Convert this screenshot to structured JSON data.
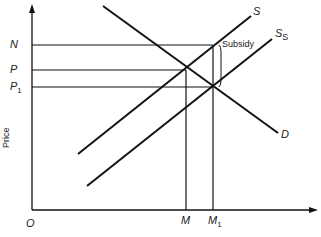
{
  "diagram": {
    "title": "",
    "y_axis_label": "Price",
    "origin_label": "O",
    "price_labels": [
      {
        "id": "N",
        "text": "N",
        "sub": ""
      },
      {
        "id": "P",
        "text": "P",
        "sub": ""
      },
      {
        "id": "P1",
        "text": "P",
        "sub": "1"
      }
    ],
    "quantity_labels": [
      {
        "id": "M",
        "text": "M",
        "sub": ""
      },
      {
        "id": "M1",
        "text": "M",
        "sub": "1"
      }
    ],
    "curves": [
      {
        "id": "S",
        "text": "S",
        "sub": ""
      },
      {
        "id": "Ss",
        "text": "S",
        "sub": "S"
      },
      {
        "id": "D",
        "text": "D",
        "sub": ""
      }
    ],
    "annotation": "Subsidy",
    "line_color": "#111111"
  }
}
